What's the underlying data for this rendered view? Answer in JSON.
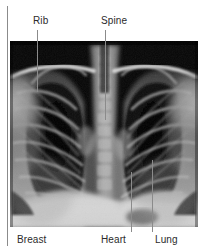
{
  "figure": {
    "width": 209,
    "height": 252,
    "background_color": "#ffffff",
    "image_type": "radiograph",
    "view": "PA chest",
    "plate": {
      "x": 10,
      "y": 41,
      "width": 188,
      "height": 186,
      "background_color": "#050505"
    },
    "line_color": "#8b8b8b",
    "text_color": "#2b2b2b"
  },
  "labels": {
    "top": [
      {
        "id": "rib",
        "text": "Rib",
        "text_x": 33,
        "text_y": 15
      },
      {
        "id": "spine",
        "text": "Spine",
        "text_x": 101,
        "text_y": 15
      }
    ],
    "bottom": [
      {
        "id": "breast",
        "text": "Breast",
        "text_x": 17,
        "text_y": 234
      },
      {
        "id": "heart",
        "text": "Heart",
        "text_x": 101,
        "text_y": 234
      },
      {
        "id": "lung",
        "text": "Lung",
        "text_x": 155,
        "text_y": 234
      }
    ]
  },
  "leader_lines": [
    {
      "id": "breast-edge",
      "x": 7,
      "y": 6,
      "height": 240
    },
    {
      "id": "rib",
      "x": 37,
      "y": 30,
      "height": 62
    },
    {
      "id": "spine",
      "x": 105,
      "y": 30,
      "height": 90
    },
    {
      "id": "heart",
      "x": 131,
      "y": 172,
      "height": 60
    },
    {
      "id": "lung",
      "x": 152,
      "y": 160,
      "height": 72
    }
  ]
}
